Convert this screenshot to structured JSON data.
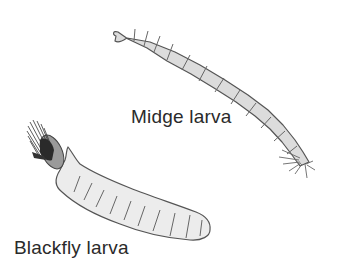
{
  "figure": {
    "labels": {
      "midge": "Midge larva",
      "blackfly": "Blackfly larva"
    },
    "colors": {
      "midge_body": "#dcdcdc",
      "blackfly_body": "#ececec",
      "outline": "#555555",
      "fan": "#3a3a3a",
      "text": "#2a2a2a"
    }
  }
}
